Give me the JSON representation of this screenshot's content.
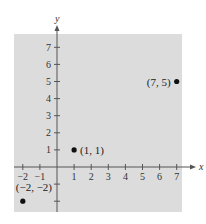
{
  "chart_data": {
    "type": "scatter",
    "title": "",
    "xlabel": "x",
    "ylabel": "y",
    "xlim": [
      -2.5,
      7.5
    ],
    "ylim": [
      -2.5,
      7.5
    ],
    "grid": false,
    "x_ticks": [
      -2,
      -1,
      1,
      2,
      3,
      4,
      5,
      6,
      7
    ],
    "y_ticks": [
      1,
      2,
      3,
      4,
      5,
      6,
      7
    ],
    "points": [
      {
        "x": 7,
        "y": 5,
        "label": "(7, 5)"
      },
      {
        "x": 1,
        "y": 1,
        "label": "(1, 1)"
      },
      {
        "x": -2,
        "y": -2,
        "label": "(−2, −2)"
      }
    ]
  },
  "colors": {
    "background_panel": "#dcdcdc",
    "axis": "#555555",
    "point": "#111111"
  }
}
